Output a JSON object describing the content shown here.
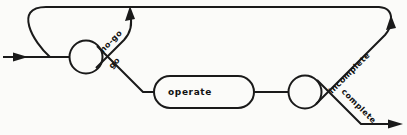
{
  "diagram": {
    "type": "flow-diagram",
    "colors": {
      "line": "#1a1a1a",
      "background": "#fbfbf9",
      "text": "#111111"
    },
    "nodes": {
      "operate": "operate"
    },
    "edge_labels": {
      "no_go": "no-go",
      "go": "go",
      "incomplete": "incomplete",
      "complete": "complete"
    }
  }
}
